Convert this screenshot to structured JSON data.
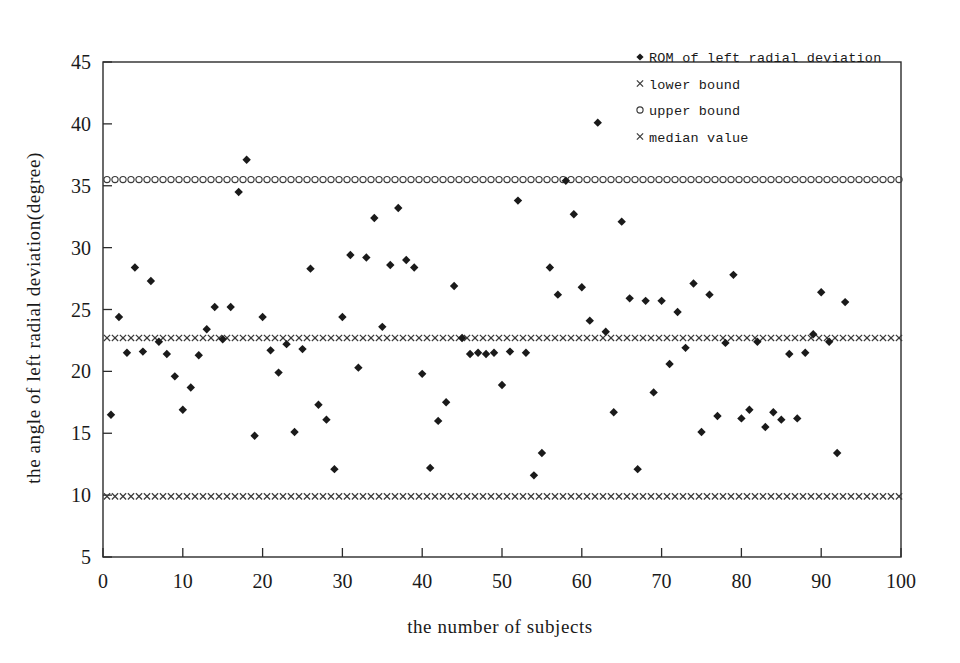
{
  "chart_data": {
    "type": "scatter",
    "title": "",
    "xlabel": "the number of subjects",
    "ylabel": "the angle of left radial deviation(degree)",
    "xlim": [
      0,
      100
    ],
    "ylim": [
      5,
      45
    ],
    "xticks": [
      0,
      10,
      20,
      30,
      40,
      50,
      60,
      70,
      80,
      90,
      100
    ],
    "yticks": [
      5,
      10,
      15,
      20,
      25,
      30,
      35,
      40,
      45
    ],
    "grid": false,
    "legend_position": "top-right",
    "legend": [
      {
        "label": "ROM of left radial deviation",
        "marker": "diamond"
      },
      {
        "label": "lower bound",
        "marker": "x"
      },
      {
        "label": "upper bound",
        "marker": "circle"
      },
      {
        "label": "median value",
        "marker": "x"
      }
    ],
    "reference_lines": [
      {
        "name": "upper bound",
        "value": 35.5,
        "marker": "circle"
      },
      {
        "name": "median value",
        "value": 22.7,
        "marker": "x"
      },
      {
        "name": "lower bound",
        "value": 9.9,
        "marker": "x"
      }
    ],
    "series": [
      {
        "name": "ROM of left radial deviation",
        "marker": "diamond",
        "points": [
          [
            1,
            16.5
          ],
          [
            2,
            24.4
          ],
          [
            3,
            21.5
          ],
          [
            4,
            28.4
          ],
          [
            5,
            21.6
          ],
          [
            6,
            27.3
          ],
          [
            7,
            22.4
          ],
          [
            8,
            21.4
          ],
          [
            9,
            19.6
          ],
          [
            10,
            16.9
          ],
          [
            11,
            18.7
          ],
          [
            12,
            21.3
          ],
          [
            13,
            23.4
          ],
          [
            14,
            25.2
          ],
          [
            15,
            22.6
          ],
          [
            16,
            25.2
          ],
          [
            17,
            34.5
          ],
          [
            18,
            37.1
          ],
          [
            19,
            14.8
          ],
          [
            20,
            24.4
          ],
          [
            21,
            21.7
          ],
          [
            22,
            19.9
          ],
          [
            23,
            22.2
          ],
          [
            24,
            15.1
          ],
          [
            25,
            21.8
          ],
          [
            26,
            28.3
          ],
          [
            27,
            17.3
          ],
          [
            28,
            16.1
          ],
          [
            29,
            12.1
          ],
          [
            30,
            24.4
          ],
          [
            31,
            29.4
          ],
          [
            32,
            20.3
          ],
          [
            33,
            29.2
          ],
          [
            34,
            32.4
          ],
          [
            35,
            23.6
          ],
          [
            36,
            28.6
          ],
          [
            37,
            33.2
          ],
          [
            38,
            29.0
          ],
          [
            39,
            28.4
          ],
          [
            40,
            19.8
          ],
          [
            41,
            12.2
          ],
          [
            42,
            16.0
          ],
          [
            43,
            17.5
          ],
          [
            44,
            26.9
          ],
          [
            45,
            22.7
          ],
          [
            46,
            21.4
          ],
          [
            47,
            21.5
          ],
          [
            48,
            21.4
          ],
          [
            49,
            21.5
          ],
          [
            50,
            18.9
          ],
          [
            51,
            21.6
          ],
          [
            52,
            33.8
          ],
          [
            53,
            21.5
          ],
          [
            54,
            11.6
          ],
          [
            55,
            13.4
          ],
          [
            56,
            28.4
          ],
          [
            57,
            26.2
          ],
          [
            58,
            35.4
          ],
          [
            59,
            32.7
          ],
          [
            60,
            26.8
          ],
          [
            61,
            24.1
          ],
          [
            62,
            40.1
          ],
          [
            63,
            23.2
          ],
          [
            64,
            16.7
          ],
          [
            65,
            32.1
          ],
          [
            66,
            25.9
          ],
          [
            67,
            12.1
          ],
          [
            68,
            25.7
          ],
          [
            69,
            18.3
          ],
          [
            70,
            25.7
          ],
          [
            71,
            20.6
          ],
          [
            72,
            24.8
          ],
          [
            73,
            21.9
          ],
          [
            74,
            27.1
          ],
          [
            75,
            15.1
          ],
          [
            76,
            26.2
          ],
          [
            77,
            16.4
          ],
          [
            78,
            22.3
          ],
          [
            79,
            27.8
          ],
          [
            80,
            16.2
          ],
          [
            81,
            16.9
          ],
          [
            82,
            22.4
          ],
          [
            83,
            15.5
          ],
          [
            84,
            16.7
          ],
          [
            85,
            16.1
          ],
          [
            86,
            21.4
          ],
          [
            87,
            16.2
          ],
          [
            88,
            21.5
          ],
          [
            89,
            23.0
          ],
          [
            90,
            26.4
          ],
          [
            91,
            22.4
          ],
          [
            92,
            13.4
          ],
          [
            93,
            25.6
          ]
        ]
      }
    ]
  },
  "colors": {
    "marker": "#1a1a1a",
    "axis": "#2b2b2b",
    "background": "#ffffff"
  }
}
